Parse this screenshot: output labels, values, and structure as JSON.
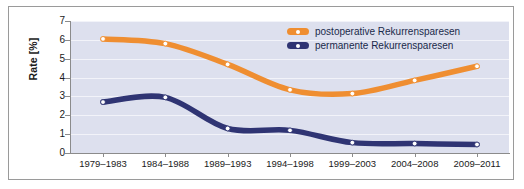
{
  "chart_data": {
    "type": "line",
    "title": "",
    "subtitle": "",
    "xlabel": "",
    "ylabel": "Rate [%]",
    "categories": [
      "1979–1983",
      "1984–1988",
      "1989–1993",
      "1994–1998",
      "1999–2003",
      "2004–2008",
      "2009–2011"
    ],
    "ylim": [
      0,
      7
    ],
    "y_ticks": [
      0,
      1,
      2,
      3,
      4,
      5,
      6,
      7
    ],
    "y_tick_labels": [
      "0",
      "1",
      "2",
      "3",
      "4",
      "5",
      "6",
      "7"
    ],
    "grid": true,
    "grid_axis": "y",
    "legend_position": "top-right",
    "series": [
      {
        "name": "postoperative Rekurrensparesen",
        "color": "#ef8e31",
        "values": [
          6.05,
          5.8,
          4.7,
          3.35,
          3.15,
          3.85,
          4.6
        ]
      },
      {
        "name": "permanente Rekurrensparesen",
        "color": "#2f3473",
        "values": [
          2.7,
          2.95,
          1.3,
          1.2,
          0.55,
          0.5,
          0.45
        ]
      }
    ],
    "colors": {
      "plot_background": "#dde0ee",
      "gridline": "#f2f3f9",
      "axis": "#8b8b8b",
      "card_border": "#9a9a9a",
      "page_background": "#ffffff",
      "orange_series": "#ef8e31",
      "blue_series": "#2f3473",
      "marker_fill": "#ffffff",
      "legend_text": "#1a2a4a",
      "tick_text": "#1a1a1a"
    }
  }
}
